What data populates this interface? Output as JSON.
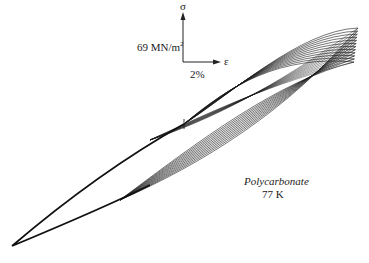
{
  "figure": {
    "material": "Polycarbonate",
    "temperature": "77 K",
    "scale_bar": {
      "y_axis_symbol": "σ",
      "x_axis_symbol": "ε",
      "stress_scale": "69 MN/m",
      "stress_scale_superscript": "2",
      "strain_scale": "2%"
    },
    "loop_count": 12,
    "colors": {
      "line": "#1a1a1a",
      "background": "#ffffff"
    }
  }
}
